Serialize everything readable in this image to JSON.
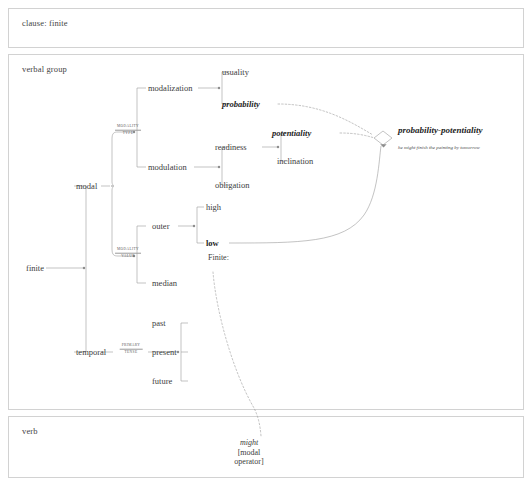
{
  "panels": [
    {
      "id": "clause",
      "label": "clause: finite"
    },
    {
      "id": "verbal",
      "label": "verbal group"
    },
    {
      "id": "verb",
      "label": "verb"
    }
  ],
  "entry": {
    "label": "finite"
  },
  "systems": [
    {
      "name": "finiteness",
      "line1": "",
      "line2": ""
    },
    {
      "name": "modality-type",
      "line1": "MODALITY",
      "line2": "TYPE"
    },
    {
      "name": "modality-value",
      "line1": "MODALITY",
      "line2": "VALUE"
    },
    {
      "name": "primary-tense",
      "line1": "PRIMARY",
      "line2": "TENSE"
    }
  ],
  "features": {
    "modal": "modal",
    "temporal": "temporal",
    "modalization": "modalization",
    "modulation": "modulation",
    "usuality": "usuality",
    "probability": "probability",
    "readiness": "readiness",
    "obligation": "obligation",
    "potentiality": "potentiality",
    "inclination": "inclination",
    "outer": "outer",
    "median": "median",
    "high": "high",
    "low": "low",
    "past": "past",
    "present": "present",
    "future": "future"
  },
  "selection": {
    "gate_label": "probability-potentiality",
    "gate_gloss": "he might finish the painting by tomorrow",
    "realization": "Finite:"
  },
  "wording": {
    "lexical_item": "might",
    "class_line1": "[modal",
    "class_line2": "operator]"
  },
  "colors": {
    "panel_border": "#d2d2d2",
    "wire": "#9a9a9a",
    "dotted_wire": "#9e9e9e",
    "text": "#3c3c3c",
    "bold_text": "#1d1d1d"
  }
}
